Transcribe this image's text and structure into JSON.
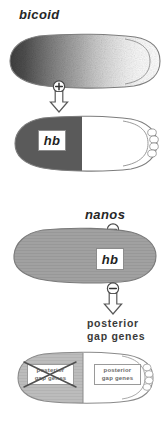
{
  "figure": {
    "organism_axis": {
      "anterior": "left",
      "posterior": "right"
    }
  },
  "labels": {
    "bicoid": "bicoid",
    "nanos": "nanos",
    "posterior_gap_genes": "posterior\ngap genes",
    "posterior_gap_genes_line1": "posterior",
    "posterior_gap_genes_line2": "gap genes"
  },
  "stages": [
    {
      "name": "embryo-bicoid-gradient",
      "gene": "bicoid",
      "pattern": "anterior-to-posterior gradient",
      "shading": "dark anterior fading to white posterior",
      "fill_dark": "#4a4a4a",
      "fill_light": "#ffffff",
      "outline": "#7d7d7d"
    },
    {
      "name": "embryo-hb-anterior",
      "gene": "hb",
      "pattern": "anterior half expressed",
      "label": "hb",
      "fill_expressed": "#595959",
      "fill_unexpressed": "#ffffff",
      "outline": "#7d7d7d"
    },
    {
      "name": "embryo-hb-uniform",
      "gene": "hb",
      "pattern": "uniform",
      "label": "hb",
      "fill": "#9e9e9e",
      "outline": "#7d7d7d"
    },
    {
      "name": "embryo-gap-genes",
      "gene": "posterior gap genes",
      "pattern": "posterior half expressed, anterior half repressed",
      "fill_repressed_region": "#b5b5b5",
      "fill_expressed_region": "#ffffff",
      "outline": "#8a8a8a"
    }
  ],
  "protein_boxes": [
    {
      "name": "protein-box-hb-anterior",
      "text": "hb"
    },
    {
      "name": "protein-box-hb-uniform",
      "text": "hb"
    }
  ],
  "domain_boxes": [
    {
      "name": "domain-box-repressed",
      "text": "posterior\ngap genes",
      "state": "repressed",
      "crossed_out": true
    },
    {
      "name": "domain-box-expressed",
      "text": "posterior\ngap genes",
      "state": "expressed",
      "crossed_out": false
    }
  ],
  "connectors": [
    {
      "name": "connector-bicoid-activates-hb",
      "sign": "+",
      "sign_icon": "plus-circle-icon",
      "arrow_icon": "down-arrow-icon",
      "interaction": "activation",
      "source": "bicoid",
      "target": "hb"
    },
    {
      "name": "connector-nanos-represses-hb",
      "sign": "−",
      "sign_icon": "minus-circle-icon",
      "arrow_icon": "down-arrow-icon",
      "interaction": "repression",
      "source": "nanos",
      "target": "hb"
    },
    {
      "name": "connector-hb-represses-gap",
      "sign": "−",
      "sign_icon": "minus-circle-icon",
      "arrow_icon": "down-arrow-icon",
      "interaction": "repression",
      "source": "hb",
      "target": "posterior gap genes"
    }
  ],
  "colors": {
    "ink": "#262626",
    "label_gray": "#3a3a3a",
    "outline_gray": "#7d7d7d",
    "paper": "#ffffff"
  }
}
